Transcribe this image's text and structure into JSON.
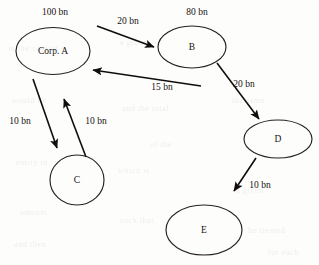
{
  "diagram": {
    "type": "directed-flow-graph",
    "unit_suffix": "bn",
    "stroke_color": "#100d0c",
    "node_stroke_color": "#26211f",
    "background_color": "#fdfdfc",
    "nodes": [
      {
        "id": "A",
        "label": "Corp. A",
        "shape": "ellipse",
        "cx": 53,
        "cy": 51,
        "rx": 37,
        "ry": 23.5,
        "value_label": "100 bn",
        "value_x": 55,
        "value_y": 13
      },
      {
        "id": "B",
        "label": "B",
        "shape": "ellipse",
        "cx": 192,
        "cy": 47,
        "rx": 34,
        "ry": 21,
        "value_label": "80 bn",
        "value_x": 197,
        "value_y": 13
      },
      {
        "id": "C",
        "label": "C",
        "shape": "circle",
        "cx": 77,
        "cy": 180,
        "rx": 27,
        "ry": 25,
        "value_label": "",
        "value_x": 0,
        "value_y": 0
      },
      {
        "id": "D",
        "label": "D",
        "shape": "ellipse",
        "cx": 278,
        "cy": 139,
        "rx": 34,
        "ry": 19,
        "value_label": "",
        "value_x": 0,
        "value_y": 0
      },
      {
        "id": "E",
        "label": "E",
        "shape": "ellipse",
        "cx": 204,
        "cy": 230,
        "rx": 38,
        "ry": 25,
        "value_label": "",
        "value_x": 0,
        "value_y": 0
      }
    ],
    "edges": [
      {
        "id": "a-to-b",
        "from": "A",
        "to": "B",
        "label": "20 bn",
        "label_x": 128,
        "label_y": 22,
        "x1": 97,
        "y1": 26,
        "x2": 154,
        "y2": 47
      },
      {
        "id": "b-to-a",
        "from": "B",
        "to": "A",
        "label": "15 bn",
        "label_x": 162,
        "label_y": 88,
        "x1": 201,
        "y1": 86,
        "x2": 93,
        "y2": 70
      },
      {
        "id": "a-to-c",
        "from": "A",
        "to": "C",
        "label": "10 bn",
        "label_x": 20,
        "label_y": 122,
        "x1": 33,
        "y1": 79,
        "x2": 57,
        "y2": 148
      },
      {
        "id": "c-to-a",
        "from": "C",
        "to": "A",
        "label": "10 bn",
        "label_x": 96,
        "label_y": 122,
        "x1": 86,
        "y1": 157,
        "x2": 64,
        "y2": 99
      },
      {
        "id": "b-to-d",
        "from": "B",
        "to": "D",
        "label": "20 bn",
        "label_x": 244,
        "label_y": 85,
        "x1": 217,
        "y1": 63,
        "x2": 259,
        "y2": 119
      },
      {
        "id": "d-to-e",
        "from": "D",
        "to": "E",
        "label": "10 bn",
        "label_x": 260,
        "label_y": 186,
        "x1": 256,
        "y1": 158,
        "x2": 234,
        "y2": 191
      }
    ]
  },
  "background_marks": [
    {
      "text": "in the case of",
      "x": 8,
      "y": 44
    },
    {
      "text": "a group",
      "x": 120,
      "y": 38
    },
    {
      "text": "the same",
      "x": 232,
      "y": 96
    },
    {
      "text": "would be",
      "x": 12,
      "y": 96
    },
    {
      "text": "and the total",
      "x": 122,
      "y": 104
    },
    {
      "text": "of the",
      "x": 150,
      "y": 140
    },
    {
      "text": "entity in",
      "x": 16,
      "y": 158
    },
    {
      "text": "which is",
      "x": 118,
      "y": 166
    },
    {
      "text": "a given",
      "x": 236,
      "y": 186
    },
    {
      "text": "amount",
      "x": 20,
      "y": 208
    },
    {
      "text": "such that",
      "x": 120,
      "y": 216
    },
    {
      "text": "be treated",
      "x": 248,
      "y": 226
    },
    {
      "text": "and then",
      "x": 14,
      "y": 240
    },
    {
      "text": "for each",
      "x": 268,
      "y": 248
    }
  ]
}
